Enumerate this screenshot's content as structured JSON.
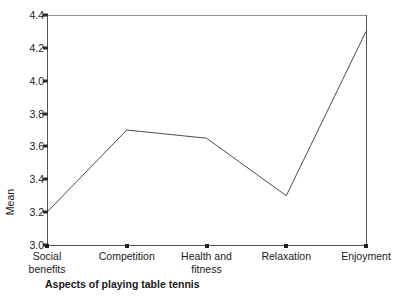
{
  "chart_data": {
    "type": "line",
    "title": "",
    "subtitle": "",
    "xlabel": "Aspects of playing table tennis",
    "ylabel": "Mean",
    "categories": [
      "Social\nbenefits",
      "Competition",
      "Health and\nfitness",
      "Relaxation",
      "Enjoyment"
    ],
    "values": [
      3.2,
      3.7,
      3.65,
      3.3,
      4.3
    ],
    "series": [
      {
        "name": "Mean",
        "values": [
          3.2,
          3.7,
          3.65,
          3.3,
          4.3
        ]
      }
    ],
    "ylim": [
      3.0,
      4.4
    ],
    "yticks": [
      "3.0",
      "3.2",
      "3.4",
      "3.6",
      "3.8",
      "4.0",
      "4.2",
      "4.4"
    ],
    "ytick_values": [
      3.0,
      3.2,
      3.4,
      3.6,
      3.8,
      4.0,
      4.2,
      4.4
    ],
    "grid": "off",
    "legend": "none",
    "line_color": "#4d4d4d",
    "marker": "none",
    "annotations": []
  },
  "figure": {
    "background_color": "#ffffff",
    "axis_color": "#555555",
    "text_color": "#1a1a1a"
  }
}
